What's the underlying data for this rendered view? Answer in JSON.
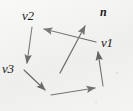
{
  "figure": {
    "name": "polygon-normal-vector-diagram",
    "background_color": "#f2f2f0",
    "ink_color": "#1a1a1a",
    "width": 133,
    "height": 111,
    "labels": {
      "v1": "v1",
      "v2": "v2",
      "v3": "v3",
      "n": "n"
    },
    "geometry": {
      "polygon_vertices": [
        [
          32,
          27
        ],
        [
          96,
          42
        ],
        [
          103,
          86
        ],
        [
          51,
          95
        ],
        [
          24,
          70
        ]
      ],
      "edges": [
        {
          "name": "top-edge",
          "from": [
            96,
            42
          ],
          "to": [
            32,
            27
          ],
          "arrow_at": "to",
          "label": "v2"
        },
        {
          "name": "left-edge",
          "from": [
            32,
            27
          ],
          "to": [
            24,
            70
          ],
          "arrow_at": "to",
          "label": "v3"
        },
        {
          "name": "bottom-left-edge",
          "from": [
            24,
            70
          ],
          "to": [
            51,
            95
          ],
          "arrow_at": "to"
        },
        {
          "name": "bottom-right-edge",
          "from": [
            51,
            95
          ],
          "to": [
            103,
            86
          ],
          "arrow_at": "to"
        },
        {
          "name": "right-edge",
          "from": [
            103,
            86
          ],
          "to": [
            96,
            42
          ],
          "arrow_at": "to",
          "label": "v1"
        }
      ],
      "normal_vector": {
        "name": "n",
        "from": [
          60,
          73
        ],
        "to": [
          88,
          19
        ],
        "arrow_at": "to"
      }
    }
  }
}
